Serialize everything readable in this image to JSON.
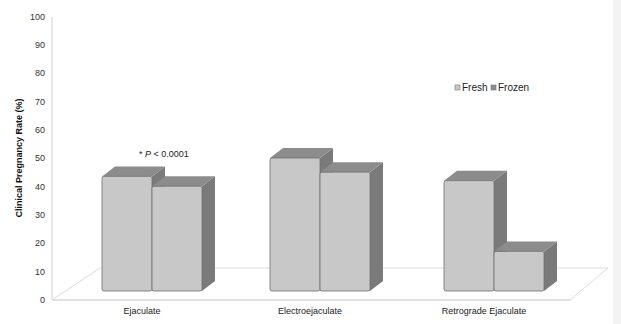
{
  "chart_data": {
    "type": "bar",
    "title": "",
    "xlabel": "",
    "ylabel": "Clinical Pregnancy Rate (%)",
    "ylim": [
      0,
      100
    ],
    "yticks": [
      0,
      10,
      20,
      30,
      40,
      50,
      60,
      70,
      80,
      90,
      100
    ],
    "categories": [
      "Ejaculate",
      "Electroejaculate",
      "Retrograde Ejaculate"
    ],
    "series": [
      {
        "name": "Fresh",
        "values": [
          40.5,
          47,
          39
        ]
      },
      {
        "name": "Frozen",
        "values": [
          37,
          42,
          14
        ]
      }
    ],
    "annotations": [
      {
        "text": "* P < 0.0001",
        "category": "Ejaculate"
      }
    ],
    "legend_position": "upper right, inside plot",
    "grid": false,
    "style": "3d clustered column"
  },
  "colors": {
    "front": "#c8c8c8",
    "side": "#7a7a7a",
    "top": "#8c8c8c",
    "axis": "#d0d0d0",
    "floor": "#dcdcdc"
  },
  "labels": {
    "ylabel": "Clinical Pregnancy Rate (%)",
    "annotation_star": "* ",
    "annotation_p": "P",
    "annotation_rest": " < 0.0001",
    "legend_fresh": "Fresh",
    "legend_frozen": "Frozen",
    "cat0": "Ejaculate",
    "cat1": "Electroejaculate",
    "cat2": "Retrograde Ejaculate",
    "t0": "0",
    "t10": "10",
    "t20": "20",
    "t30": "30",
    "t40": "40",
    "t50": "50",
    "t60": "60",
    "t70": "70",
    "t80": "80",
    "t90": "90",
    "t100": "100"
  }
}
